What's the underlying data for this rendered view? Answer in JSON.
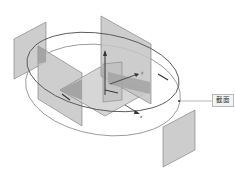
{
  "diagram": {
    "type": "3d-isometric-section-planes",
    "callout_label": "截面",
    "axis_labels": {
      "y": "y",
      "x": "x"
    },
    "colors": {
      "plane_fill": "#c9c9c9",
      "plane_dark": "#9a9a9a",
      "plane_stroke": "#777777",
      "ellipse_outer": "#555555",
      "ellipse_inner": "#8a8a8a",
      "axis": "#333333",
      "background": "#ffffff"
    },
    "elements": [
      "outer-ellipse-path",
      "inner-ellipse-path",
      "left-detached-plane",
      "left-section-plane",
      "center-horizontal-plane",
      "center-vertical-plane",
      "right-vertical-plane",
      "bottom-right-detached-plane",
      "coordinate-axes",
      "section-callout"
    ]
  }
}
